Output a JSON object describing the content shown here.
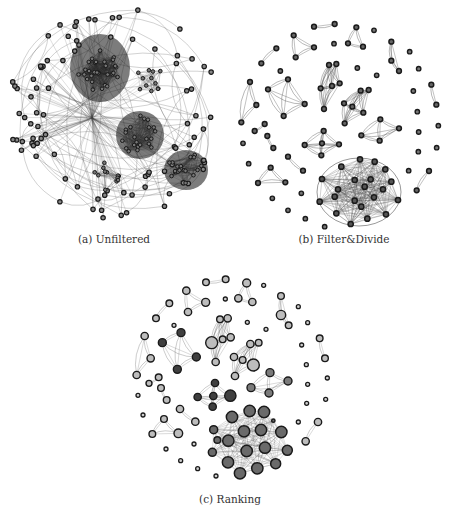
{
  "figure": {
    "panels": [
      {
        "id": "a",
        "label": "(a) Unfiltered"
      },
      {
        "id": "b",
        "label": "(b) Filter&Divide"
      },
      {
        "id": "c",
        "label": "(c) Ranking"
      }
    ]
  },
  "legend_colors": {
    "node_fill_dark": "#3a3a3a",
    "node_fill_mid": "#6e6e6e",
    "node_fill_light": "#b8b8b8",
    "node_stroke": "#1a1a1a",
    "edge": "#555555"
  }
}
